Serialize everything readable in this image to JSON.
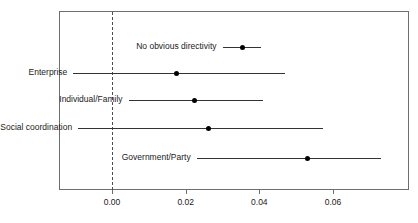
{
  "chart_data": {
    "type": "scatter",
    "title": "",
    "xlabel": "",
    "ylabel": "",
    "xlim": [
      -0.0135,
      0.0815
    ],
    "xticks": [
      0.0,
      0.02,
      0.04,
      0.06
    ],
    "xtick_labels": [
      "0.00",
      "0.02",
      "0.04",
      "0.06"
    ],
    "grid": false,
    "legend": "none",
    "reference_line": 0.0,
    "reference_line_style": "dashed",
    "orientation": "horizontal",
    "error_bars": "confidence-interval",
    "categories": [
      "No obvious directivity",
      "Enterprise",
      "Individual/Family",
      "Social coordination",
      "Government/Party"
    ],
    "points": [
      {
        "label": "No obvious directivity",
        "estimate": 0.0355,
        "ci_low": 0.03,
        "ci_high": 0.0405
      },
      {
        "label": "Enterprise",
        "estimate": 0.0175,
        "ci_low": -0.0105,
        "ci_high": 0.047
      },
      {
        "label": "Individual/Family",
        "estimate": 0.0225,
        "ci_low": 0.0045,
        "ci_high": 0.041
      },
      {
        "label": "Social coordination",
        "estimate": 0.0263,
        "ci_low": -0.0092,
        "ci_high": 0.0572
      },
      {
        "label": "Government/Party",
        "estimate": 0.053,
        "ci_low": 0.023,
        "ci_high": 0.073
      }
    ]
  }
}
